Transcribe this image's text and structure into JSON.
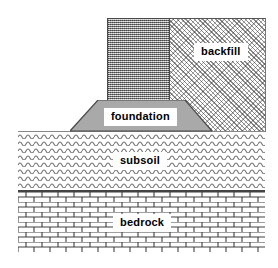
{
  "diagram": {
    "type": "geological-cross-section",
    "canvas": {
      "width": 278,
      "height": 268,
      "background": "#ffffff"
    },
    "labels": {
      "backfill": "backfill",
      "foundation": "foundation",
      "subsoil": "subsoil",
      "bedrock": "bedrock"
    },
    "layers": [
      {
        "id": "backfill",
        "label": "backfill",
        "pattern": "diagonal-stipple",
        "fill_color": "#ffffff",
        "pattern_color": "#3a3a3a",
        "bounds": {
          "x": 107,
          "y": 18,
          "width": 158,
          "height": 113
        }
      },
      {
        "id": "wall",
        "label": "",
        "pattern": "vertical-dotted-stipple",
        "fill_color": "#b8b8b8",
        "pattern_color": "#4a4a4a",
        "bounds": {
          "x": 107,
          "y": 18,
          "width": 63,
          "height": 94
        }
      },
      {
        "id": "foundation",
        "label": "foundation",
        "pattern": "solid",
        "fill_color": "#a9a9a9",
        "pattern_color": "#555555",
        "shape": "trapezoid",
        "bounds": {
          "x": 70,
          "y": 100,
          "width": 142,
          "height": 32
        }
      },
      {
        "id": "subsoil",
        "label": "subsoil",
        "pattern": "wavy-lines",
        "fill_color": "#ffffff",
        "pattern_color": "#666666",
        "bounds": {
          "x": 18,
          "y": 131,
          "width": 247,
          "height": 59
        }
      },
      {
        "id": "bedrock",
        "label": "bedrock",
        "pattern": "brick-masonry",
        "fill_color": "#ffffff",
        "pattern_color": "#444444",
        "bounds": {
          "x": 18,
          "y": 190,
          "width": 247,
          "height": 60
        }
      }
    ]
  }
}
